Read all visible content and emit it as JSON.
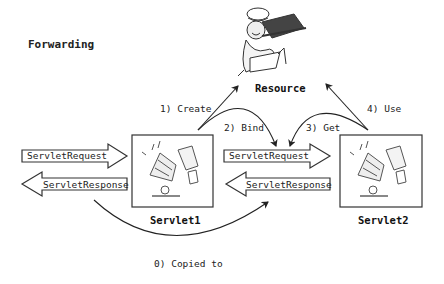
{
  "title": "Forwarding",
  "nodes": {
    "resource": {
      "label": "Resource"
    },
    "servlet1": {
      "label": "Servlet1"
    },
    "servlet2": {
      "label": "Servlet2"
    }
  },
  "arrows": {
    "left_request": "ServletRequest",
    "left_response": "ServletResponse",
    "mid_request": "ServletRequest",
    "mid_response": "ServletResponse"
  },
  "steps": {
    "copied": "0) Copied to",
    "create": "1) Create",
    "bind": "2) Bind",
    "get": "3) Get",
    "use": "4) Use"
  },
  "colors": {
    "stroke": "#333333",
    "text": "#222222",
    "background": "#ffffff"
  }
}
